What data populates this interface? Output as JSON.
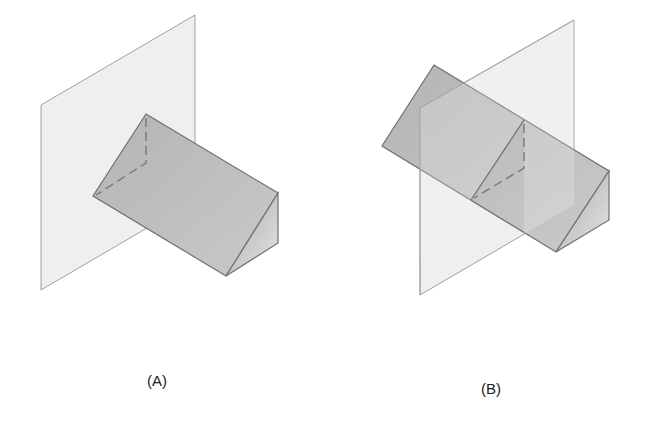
{
  "figure": {
    "panels": [
      {
        "id": "A",
        "label": "(A)"
      },
      {
        "id": "B",
        "label": "(B)"
      }
    ],
    "colors": {
      "plane_fill": "#efefef",
      "plane_stroke": "#9a9a9a",
      "prism_top": "#bdbdbd",
      "prism_side": "#d4d4d4",
      "edge": "#6f6f6f",
      "hidden_edge": "#777777"
    }
  }
}
